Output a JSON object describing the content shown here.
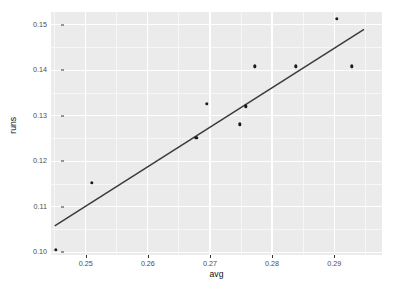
{
  "chart_data": {
    "type": "scatter",
    "title": "",
    "xlabel": "avg",
    "ylabel": "runs",
    "xlim": [
      0.2444,
      0.2977
    ],
    "ylim": [
      0.0994,
      0.1528
    ],
    "grid": true,
    "legend": null,
    "x_ticks": [
      0.25,
      0.26,
      0.27,
      0.28,
      0.29
    ],
    "x_tick_labels": [
      "0.25",
      "0.26",
      "0.27",
      "0.28",
      "0.29"
    ],
    "y_ticks": [
      0.1,
      0.11,
      0.12,
      0.13,
      0.14,
      0.15
    ],
    "y_tick_labels": [
      "0.10",
      "0.11",
      "0.12",
      "0.13",
      "0.14",
      "0.15"
    ],
    "x_minor_ticks": [
      0.245,
      0.255,
      0.265,
      0.275,
      0.285,
      0.295
    ],
    "y_minor_ticks": [
      0.105,
      0.115,
      0.125,
      0.135,
      0.145
    ],
    "points": [
      {
        "x": 0.2452,
        "y": 0.1005
      },
      {
        "x": 0.251,
        "y": 0.1152
      },
      {
        "x": 0.2678,
        "y": 0.1252
      },
      {
        "x": 0.2695,
        "y": 0.1326
      },
      {
        "x": 0.2748,
        "y": 0.1281
      },
      {
        "x": 0.2758,
        "y": 0.1321
      },
      {
        "x": 0.2772,
        "y": 0.1409
      },
      {
        "x": 0.2838,
        "y": 0.1409
      },
      {
        "x": 0.2904,
        "y": 0.1513
      },
      {
        "x": 0.2928,
        "y": 0.1409
      }
    ],
    "fit_line": {
      "type": "linear-fit",
      "color": "#3b3b3b",
      "x_start": 0.245,
      "y_start": 0.1058,
      "x_end": 0.2948,
      "y_end": 0.149
    },
    "style": {
      "panel_background": "#ebebeb",
      "major_grid_color": "#ffffff",
      "minor_grid_color": "#f7f7f7",
      "point_color": "#1a1a1a",
      "text_color": "#4d4d4d",
      "axis_title_color": "#111111"
    }
  }
}
